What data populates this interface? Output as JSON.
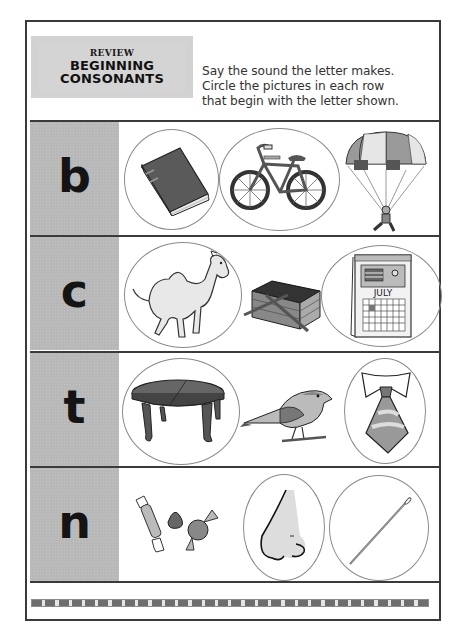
{
  "worksheet": {
    "title_box": {
      "line1": "REVIEW",
      "line2": "BEGINNING",
      "line3": "CONSONANTS"
    },
    "instructions": [
      "Say the sound the letter makes.",
      "Circle the pictures in each row",
      "that begin with the letter shown."
    ],
    "rows": [
      {
        "letter": "b",
        "pictures": [
          {
            "name": "book",
            "circled": true
          },
          {
            "name": "bicycle",
            "circled": true
          },
          {
            "name": "parachute",
            "circled": false
          }
        ]
      },
      {
        "letter": "c",
        "pictures": [
          {
            "name": "camel",
            "circled": true
          },
          {
            "name": "picnic basket",
            "circled": false
          },
          {
            "name": "calendar",
            "circled": true,
            "label": "JULY"
          }
        ]
      },
      {
        "letter": "t",
        "pictures": [
          {
            "name": "table",
            "circled": true
          },
          {
            "name": "bird",
            "circled": false
          },
          {
            "name": "tie",
            "circled": true
          }
        ]
      },
      {
        "letter": "n",
        "pictures": [
          {
            "name": "candy",
            "circled": false
          },
          {
            "name": "nose",
            "circled": true
          },
          {
            "name": "needle",
            "circled": true
          }
        ]
      }
    ],
    "colors": {
      "letter_column": "#b8b8b8",
      "border": "#3a3a3a",
      "circle": "#8a8a8a",
      "text": "#333333"
    }
  }
}
